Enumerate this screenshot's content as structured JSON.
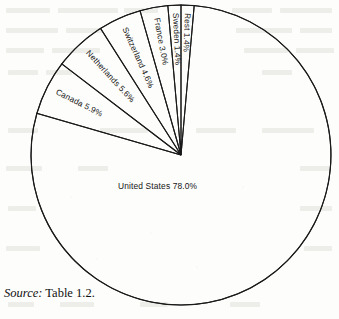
{
  "caption": {
    "source_word": "Source:",
    "reference": "Table 1.2."
  },
  "chart_data": {
    "type": "pie",
    "title": "",
    "subtitle": "",
    "xlabel": "",
    "ylabel": "",
    "units": "percent",
    "legend": "none",
    "grid": false,
    "style": {
      "fill": "#ffffff",
      "stroke": "#1a1a1a",
      "background": "#fdfdfb"
    },
    "total_labeled": 99.9,
    "categories": [
      "United States",
      "Canada",
      "Netherlands",
      "Switzerland",
      "France",
      "Sweden",
      "Rest"
    ],
    "values": [
      78.0,
      5.9,
      5.6,
      4.6,
      3.0,
      1.4,
      1.4
    ],
    "slices": [
      {
        "name": "United States",
        "value": 78.0,
        "label": "United States 78.0%",
        "label_orientation": "horizontal",
        "label_placement": "inside"
      },
      {
        "name": "Canada",
        "value": 5.9,
        "label": "Canada 5.9%",
        "label_orientation": "radial",
        "label_placement": "inside"
      },
      {
        "name": "Netherlands",
        "value": 5.6,
        "label": "Netherlands 5.6%",
        "label_orientation": "radial",
        "label_placement": "inside"
      },
      {
        "name": "Switzerland",
        "value": 4.6,
        "label": "Switzerland 4.6%",
        "label_orientation": "radial",
        "label_placement": "inside"
      },
      {
        "name": "France",
        "value": 3.0,
        "label": "France 3.0%",
        "label_orientation": "radial",
        "label_placement": "inside"
      },
      {
        "name": "Sweden",
        "value": 1.4,
        "label": "Sweden 1.4%",
        "label_orientation": "radial",
        "label_placement": "inside"
      },
      {
        "name": "Rest",
        "value": 1.4,
        "label": "Rest 1.4%",
        "label_orientation": "radial",
        "label_placement": "inside"
      }
    ]
  }
}
